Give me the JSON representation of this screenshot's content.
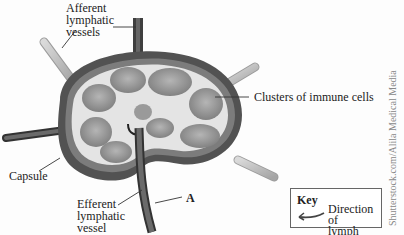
{
  "figure": {
    "labels": {
      "afferent": "Afferent\nlymphatic\nvessels",
      "clusters": "Clusters of immune cells",
      "capsule": "Capsule",
      "efferent": "Efferent\nlymphatic\nvessel",
      "a": "A"
    },
    "key": {
      "title": "Key",
      "arrow_icon": "curved-arrow-left-icon",
      "description": "Direction of\nlymph flow"
    },
    "credit": "Shutterstock.com/Alila Medical Media",
    "colors": {
      "capsule": "#5a5a5a",
      "capsule_inner": "#8a8a8a",
      "cortex_bg": "#b8b8b8",
      "nodule": "#9a9a9a",
      "sinus": "#e6e6e6",
      "vessel_light": "#c9c9c9",
      "vessel_dark": "#4a4a4a"
    }
  }
}
